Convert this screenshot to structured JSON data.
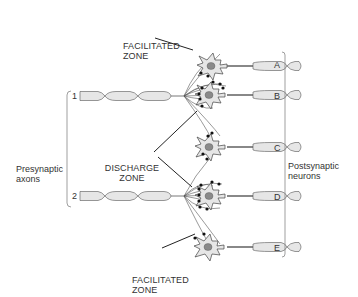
{
  "colors": {
    "cell_fill": "#e6e6e6",
    "nucleus": "#8a8a8a",
    "stroke": "#444444",
    "terminal": "#111111",
    "text": "#333333"
  },
  "labels": {
    "facilitated_zone_top": [
      "FACILITATED",
      "ZONE"
    ],
    "discharge_zone": [
      "DISCHARGE",
      "ZONE"
    ],
    "facilitated_zone_bottom": [
      "FACILITATED",
      "ZONE"
    ],
    "presynaptic": [
      "Presynaptic",
      "axons"
    ],
    "postsynaptic": [
      "Postsynaptic",
      "neurons"
    ]
  },
  "axons": [
    {
      "id": "1",
      "label": "1"
    },
    {
      "id": "2",
      "label": "2"
    }
  ],
  "neurons": [
    {
      "id": "A",
      "label": "A"
    },
    {
      "id": "B",
      "label": "B"
    },
    {
      "id": "C",
      "label": "C"
    },
    {
      "id": "D",
      "label": "D"
    },
    {
      "id": "E",
      "label": "E"
    }
  ]
}
